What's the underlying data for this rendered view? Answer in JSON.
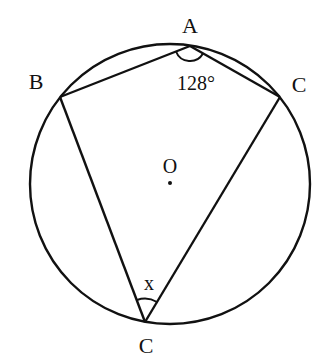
{
  "figure": {
    "type": "circle-geometry",
    "circle": {
      "center": [
        170,
        184
      ],
      "radius": 141,
      "stroke": "#111111"
    },
    "center_point": {
      "label": "O",
      "pos": [
        170,
        183
      ],
      "label_pos": [
        170,
        166
      ]
    },
    "points": [
      {
        "id": "A",
        "label": "A",
        "pos": [
          190,
          46
        ],
        "label_pos": [
          190,
          26
        ]
      },
      {
        "id": "B",
        "label": "B",
        "pos": [
          60,
          97
        ],
        "label_pos": [
          36,
          82
        ]
      },
      {
        "id": "C1",
        "label": "C",
        "pos": [
          280,
          97
        ],
        "label_pos": [
          299,
          85
        ]
      },
      {
        "id": "C2",
        "label": "C",
        "pos": [
          145,
          322
        ],
        "label_pos": [
          146,
          346
        ]
      }
    ],
    "segments": [
      [
        "B",
        "A"
      ],
      [
        "A",
        "C1"
      ],
      [
        "B",
        "C2"
      ],
      [
        "C1",
        "C2"
      ]
    ],
    "angles": [
      {
        "vertex": "A",
        "label": "128°",
        "label_pos": [
          196,
          83
        ]
      },
      {
        "vertex": "C2",
        "label": "x",
        "label_pos": [
          149,
          284
        ]
      }
    ]
  }
}
